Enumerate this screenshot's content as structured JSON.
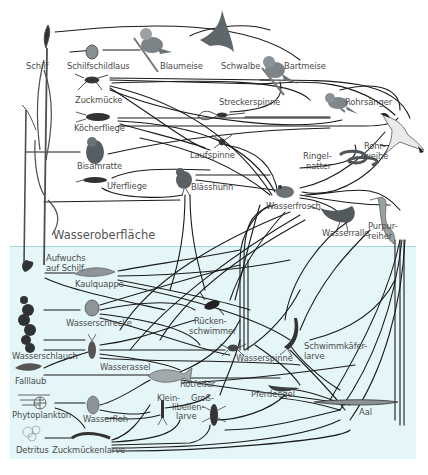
{
  "colors": {
    "background": "#ffffff",
    "water": "#e4f6f8",
    "water_line": "#9fd6dc",
    "link": "#1a1a1a",
    "organism": "#6d7275",
    "label": "#4a4a4a"
  },
  "zones": {
    "surface_label": "Wasseroberfläche"
  },
  "organisms": {
    "schilf": "Schilf",
    "schilfschildlaus": "Schilfschildlaus",
    "blaumeise": "Blaumeise",
    "schwalbe": "Schwalbe",
    "bartmeise": "Bartmeise",
    "zuckmuecke": "Zuckmücke",
    "streckerspinne": "Streckerspinne",
    "rohrsaenger": "Rohrsänger",
    "koecherfliege": "Köcherfliege",
    "rohrweihe_1": "Rohr-",
    "rohrweihe_2": "weihe",
    "bisamratte": "Bisamratte",
    "laufspinne": "Laufspinne",
    "ringelnatter_1": "Ringel-",
    "ringelnatter_2": "natter",
    "uferfliege": "Uferfliege",
    "blaesshuhn": "Blässhuhn",
    "wasserfrosch": "Wasserfrosch",
    "wasserralle": "Wasserralle",
    "purpurreiher_1": "Purpur-",
    "purpurreiher_2": "reiher",
    "aufwuchs_1": "Aufwuchs",
    "aufwuchs_2": "auf Schilf",
    "kaulquappe": "Kaulquappe",
    "wasserschrecke": "Wasserschrecke",
    "rueckenschwimmer_1": "Rücken-",
    "rueckenschwimmer_2": "schwimmer",
    "schwimmkaeferlarve_1": "Schwimmkäfer-",
    "schwimmkaeferlarve_2": "larve",
    "wasserschlauch": "Wasserschlauch",
    "wasserassel": "Wasserassel",
    "wasserspinne": "Wasserspinne",
    "falllaub": "Falllaub",
    "rotfeder": "Rotfeder",
    "pferdeegel": "Pferdeegel",
    "phytoplankton": "Phytoplankton",
    "wasserfloh": "Wasserfloh",
    "kleinlibellenlarve_1": "Klein-",
    "grosslibellenlarve_1": "Groß-",
    "libellenlarve_2": "libellen-",
    "libellenlarve_3": "larve",
    "aal": "Aal",
    "detritus": "Detritus",
    "zuckmueckenlarve": "Zuckmückenlarve"
  },
  "icons": {
    "schilf": "reed-plant-icon",
    "blaumeise": "blue-tit-bird-icon",
    "schwalbe": "swallow-bird-icon",
    "bartmeise": "bearded-tit-bird-icon",
    "rohrsaenger": "reed-warbler-bird-icon",
    "rohrweihe": "marsh-harrier-bird-icon",
    "wasserfrosch": "frog-icon",
    "rotfeder": "fish-icon",
    "aal": "eel-icon"
  }
}
